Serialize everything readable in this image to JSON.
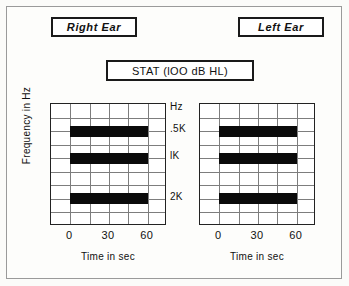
{
  "figure": {
    "ear_labels": {
      "right": "Right  Ear",
      "left": "Left  Ear"
    },
    "stimulus_label": "STAT (lOO dB HL)"
  },
  "chart_data": [
    {
      "type": "bar",
      "title": "Right  Ear",
      "orientation": "horizontal",
      "xlabel": "Time in sec",
      "ylabel": "Frequency in Hz",
      "xlim": [
        -15,
        75
      ],
      "xticks": [
        0,
        30,
        60
      ],
      "xtick_labels": [
        "0",
        "30",
        "60"
      ],
      "categories": [
        ".5K",
        "lK",
        "2K"
      ],
      "ytop_label": "Hz",
      "grid": true,
      "grid_columns": 6,
      "grid_rows": 9,
      "bars": [
        {
          "frequency": ".5K",
          "start_sec": 0,
          "end_sec": 60,
          "duration_sec": 60
        },
        {
          "frequency": "lK",
          "start_sec": 0,
          "end_sec": 60,
          "duration_sec": 60
        },
        {
          "frequency": "2K",
          "start_sec": 0,
          "end_sec": 60,
          "duration_sec": 60
        }
      ],
      "values": [
        60,
        60,
        60
      ]
    },
    {
      "type": "bar",
      "title": "Left  Ear",
      "orientation": "horizontal",
      "xlabel": "Time in sec",
      "ylabel": "Frequency in Hz",
      "xlim": [
        -15,
        75
      ],
      "xticks": [
        0,
        30,
        60
      ],
      "xtick_labels": [
        "0",
        "30",
        "60"
      ],
      "categories": [
        ".5K",
        "lK",
        "2K"
      ],
      "ytop_label": "Hz",
      "grid": true,
      "grid_columns": 6,
      "grid_rows": 9,
      "bars": [
        {
          "frequency": ".5K",
          "start_sec": 0,
          "end_sec": 60,
          "duration_sec": 60
        },
        {
          "frequency": "lK",
          "start_sec": 0,
          "end_sec": 60,
          "duration_sec": 60
        },
        {
          "frequency": "2K",
          "start_sec": 0,
          "end_sec": 60,
          "duration_sec": 60
        }
      ],
      "values": [
        60,
        60,
        60
      ]
    }
  ],
  "colors": {
    "bar": "#0a0a0a",
    "grid": "#7d7d7d",
    "axis": "#222222",
    "frame": "#9a9a9a",
    "background": "#fdfdfb"
  }
}
